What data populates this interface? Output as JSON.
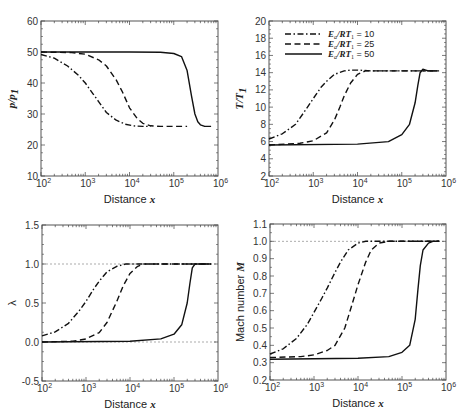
{
  "figure": {
    "legend": {
      "entries": [
        {
          "label": "E_a/RT_1 = 10",
          "main": "E",
          "sub1": "a",
          "mid": "/RT",
          "sub2": "1",
          "value": " = 10",
          "style": "dashdot"
        },
        {
          "label": "E_a/RT_1 = 25",
          "main": "E",
          "sub1": "a",
          "mid": "/RT",
          "sub2": "1",
          "value": " = 25",
          "style": "dashed"
        },
        {
          "label": "E_a/RT_1 = 50",
          "main": "E",
          "sub1": "a",
          "mid": "/RT",
          "sub2": "1",
          "value": " = 50",
          "style": "solid"
        }
      ]
    },
    "x_tick_labels": [
      "10",
      "10",
      "10",
      "10",
      "10"
    ],
    "x_tick_exponents": [
      "2",
      "3",
      "4",
      "5",
      "6"
    ]
  },
  "chart_data": [
    {
      "id": "pressure",
      "type": "line",
      "title": "",
      "xlabel": "Distance x",
      "ylabel": "p/p_1",
      "xscale": "log",
      "xlim": [
        100,
        1000000
      ],
      "ylim": [
        10,
        60
      ],
      "yticks": [
        10,
        20,
        30,
        40,
        50,
        60
      ],
      "ytick_labels": [
        "10",
        "20",
        "30",
        "40",
        "50",
        "60"
      ],
      "reference_lines": [],
      "frame": {
        "x0": 41,
        "x1": 218,
        "y0": 21,
        "y1": 176
      },
      "series": [
        {
          "name": "E_a/RT_1 = 10",
          "style": "dashdot",
          "x": [
            100,
            200,
            400,
            700,
            1000,
            1500,
            2000,
            3000,
            5000,
            8000,
            12000,
            20000,
            30000
          ],
          "y": [
            49.2,
            48.0,
            45.5,
            42.5,
            40.0,
            36.5,
            34.0,
            30.5,
            28.0,
            26.7,
            26.2,
            26.0,
            26.0
          ]
        },
        {
          "name": "E_a/RT_1 = 25",
          "style": "dashed",
          "x": [
            100,
            500,
            1000,
            2000,
            3000,
            5000,
            7000,
            10000,
            15000,
            20000,
            30000,
            50000,
            100000,
            200000
          ],
          "y": [
            50.0,
            49.8,
            49.3,
            47.5,
            45.5,
            41.0,
            37.0,
            32.0,
            28.5,
            27.0,
            26.2,
            26.0,
            26.0,
            26.0
          ]
        },
        {
          "name": "E_a/RT_1 = 50",
          "style": "solid",
          "x": [
            100,
            10000,
            50000,
            100000,
            150000,
            200000,
            250000,
            300000,
            350000,
            400000,
            500000,
            700000
          ],
          "y": [
            50.0,
            50.0,
            49.9,
            49.5,
            48.5,
            44.0,
            36.0,
            30.0,
            27.5,
            26.5,
            26.0,
            26.0
          ]
        }
      ]
    },
    {
      "id": "temperature",
      "type": "line",
      "title": "",
      "xlabel": "Distance x",
      "ylabel": "T/T_1",
      "xscale": "log",
      "xlim": [
        100,
        1000000
      ],
      "ylim": [
        2,
        20
      ],
      "yticks": [
        2,
        4,
        6,
        8,
        10,
        12,
        14,
        16,
        18,
        20
      ],
      "ytick_labels": [
        "2",
        "4",
        "6",
        "8",
        "10",
        "12",
        "14",
        "16",
        "18",
        "20"
      ],
      "reference_lines": [],
      "frame": {
        "x0": 269,
        "x1": 446,
        "y0": 21,
        "y1": 176
      },
      "series": [
        {
          "name": "E_a/RT_1 = 10",
          "style": "dashdot",
          "x": [
            100,
            200,
            400,
            700,
            1000,
            1500,
            2000,
            3000,
            5000,
            7000,
            10000,
            20000,
            50000,
            100000,
            300000,
            700000
          ],
          "y": [
            6.3,
            6.9,
            8.0,
            9.8,
            11.0,
            12.3,
            13.0,
            13.8,
            14.2,
            14.3,
            14.3,
            14.2,
            14.2,
            14.2,
            14.2,
            14.2
          ]
        },
        {
          "name": "E_a/RT_1 = 25",
          "style": "dashed",
          "x": [
            100,
            500,
            1000,
            2000,
            3000,
            4000,
            5000,
            7000,
            10000,
            15000,
            20000,
            50000,
            100000,
            300000,
            700000
          ],
          "y": [
            5.6,
            5.8,
            6.1,
            7.0,
            8.5,
            10.0,
            11.3,
            12.8,
            13.8,
            14.2,
            14.2,
            14.2,
            14.2,
            14.2,
            14.2
          ]
        },
        {
          "name": "E_a/RT_1 = 50",
          "style": "solid",
          "x": [
            100,
            10000,
            50000,
            100000,
            150000,
            200000,
            230000,
            260000,
            300000,
            350000,
            400000,
            500000,
            700000
          ],
          "y": [
            5.6,
            5.7,
            6.0,
            6.8,
            8.0,
            10.5,
            12.5,
            14.0,
            14.4,
            14.3,
            14.2,
            14.2,
            14.2
          ]
        }
      ]
    },
    {
      "id": "reaction-progress",
      "type": "line",
      "title": "",
      "xlabel": "Distance x",
      "ylabel": "λ",
      "xscale": "log",
      "xlim": [
        100,
        1000000
      ],
      "ylim": [
        -0.5,
        1.5
      ],
      "yticks": [
        -0.5,
        0.0,
        0.5,
        1.0,
        1.5
      ],
      "ytick_labels": [
        "-0.5",
        "0.0",
        "0.5",
        "1.0",
        "1.5"
      ],
      "reference_lines": [
        0.0,
        1.0
      ],
      "frame": {
        "x0": 42,
        "x1": 218,
        "y0": 225,
        "y1": 381
      },
      "series": [
        {
          "name": "E_a/RT_1 = 10",
          "style": "dashdot",
          "x": [
            100,
            200,
            400,
            700,
            1000,
            1500,
            2000,
            3000,
            5000,
            8000,
            12000,
            20000,
            50000,
            100000,
            700000
          ],
          "y": [
            0.08,
            0.13,
            0.24,
            0.4,
            0.52,
            0.68,
            0.78,
            0.9,
            0.97,
            1.0,
            1.0,
            1.0,
            1.0,
            1.0,
            1.0
          ]
        },
        {
          "name": "E_a/RT_1 = 25",
          "style": "dashed",
          "x": [
            100,
            500,
            1000,
            2000,
            3000,
            5000,
            7000,
            10000,
            15000,
            20000,
            30000,
            50000,
            100000,
            700000
          ],
          "y": [
            0.0,
            0.01,
            0.04,
            0.12,
            0.25,
            0.52,
            0.72,
            0.88,
            0.97,
            1.0,
            1.0,
            1.0,
            1.0,
            1.0
          ]
        },
        {
          "name": "E_a/RT_1 = 50",
          "style": "solid",
          "x": [
            100,
            10000,
            50000,
            100000,
            150000,
            200000,
            230000,
            260000,
            300000,
            350000,
            400000,
            700000
          ],
          "y": [
            0.0,
            0.01,
            0.04,
            0.1,
            0.22,
            0.5,
            0.75,
            0.95,
            1.0,
            1.0,
            1.0,
            1.0
          ]
        }
      ]
    },
    {
      "id": "mach-number",
      "type": "line",
      "title": "",
      "xlabel": "Distance x",
      "ylabel": "Mach number M",
      "xscale": "log",
      "xlim": [
        100,
        1000000
      ],
      "ylim": [
        0.2,
        1.1
      ],
      "yticks": [
        0.2,
        0.3,
        0.4,
        0.5,
        0.6,
        0.7,
        0.8,
        0.9,
        1.0,
        1.1
      ],
      "ytick_labels": [
        "0.2",
        "0.3",
        "0.4",
        "0.5",
        "0.6",
        "0.7",
        "0.8",
        "0.9",
        "1.0",
        "1.1"
      ],
      "reference_lines": [
        1.0
      ],
      "frame": {
        "x0": 270,
        "x1": 446,
        "y0": 224,
        "y1": 380
      },
      "series": [
        {
          "name": "E_a/RT_1 = 10",
          "style": "dashdot",
          "x": [
            100,
            200,
            400,
            700,
            1000,
            1500,
            2000,
            3000,
            4000,
            6000,
            10000,
            15000,
            25000,
            50000,
            100000,
            700000
          ],
          "y": [
            0.35,
            0.38,
            0.44,
            0.52,
            0.59,
            0.67,
            0.73,
            0.82,
            0.88,
            0.95,
            0.99,
            1.0,
            1.0,
            1.0,
            1.0,
            1.0
          ]
        },
        {
          "name": "E_a/RT_1 = 25",
          "style": "dashed",
          "x": [
            100,
            500,
            1000,
            2000,
            3000,
            5000,
            7000,
            10000,
            15000,
            20000,
            30000,
            50000,
            100000,
            700000
          ],
          "y": [
            0.33,
            0.335,
            0.345,
            0.37,
            0.4,
            0.5,
            0.62,
            0.75,
            0.88,
            0.95,
            0.99,
            1.0,
            1.0,
            1.0
          ]
        },
        {
          "name": "E_a/RT_1 = 50",
          "style": "solid",
          "x": [
            100,
            10000,
            50000,
            100000,
            150000,
            200000,
            230000,
            260000,
            300000,
            400000,
            500000,
            700000
          ],
          "y": [
            0.32,
            0.325,
            0.335,
            0.36,
            0.4,
            0.55,
            0.72,
            0.86,
            0.95,
            0.99,
            1.0,
            1.0
          ]
        }
      ]
    }
  ]
}
